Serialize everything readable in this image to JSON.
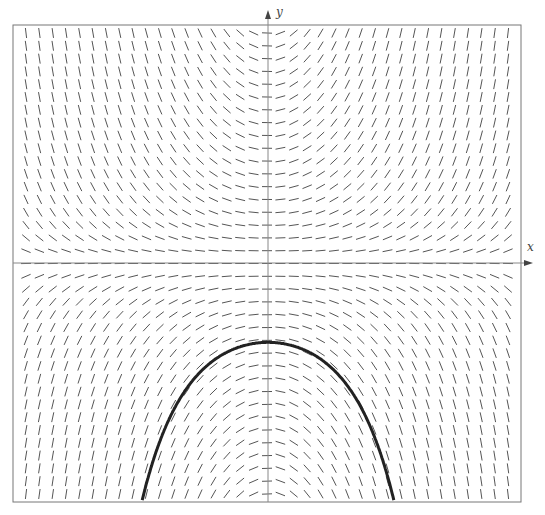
{
  "diagram": {
    "type": "slope_field",
    "equation": "dy/dx = x*y",
    "x_axis_label": "x",
    "y_axis_label": "y",
    "x_range": [
      -3,
      3
    ],
    "y_range": [
      -3,
      3
    ],
    "grid_columns": 37,
    "grid_rows": 37,
    "frame": {
      "left": 13,
      "top": 25,
      "right": 521,
      "bottom": 502
    },
    "origin_px": {
      "x": 268,
      "y": 263
    },
    "solution_curve": {
      "formula": "y = -e^(x^2/2)",
      "C": -1,
      "stroke": "#222222",
      "width": 3
    },
    "colors": {
      "segments": "#555555",
      "axes": "#888888",
      "frame": "#777777"
    }
  }
}
